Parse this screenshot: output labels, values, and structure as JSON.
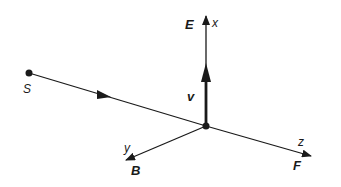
{
  "diagram": {
    "type": "vector-diagram",
    "colors": {
      "ink": "#1a1a1a",
      "background": "#ffffff"
    },
    "points": {
      "source": {
        "label": "S"
      },
      "origin": {
        "label": ""
      }
    },
    "axes": {
      "x": {
        "label": "x",
        "vector": "E"
      },
      "y": {
        "label": "y",
        "vector": "B"
      },
      "z": {
        "label": "z",
        "vector": "F"
      }
    },
    "velocity": {
      "label": "v"
    }
  }
}
